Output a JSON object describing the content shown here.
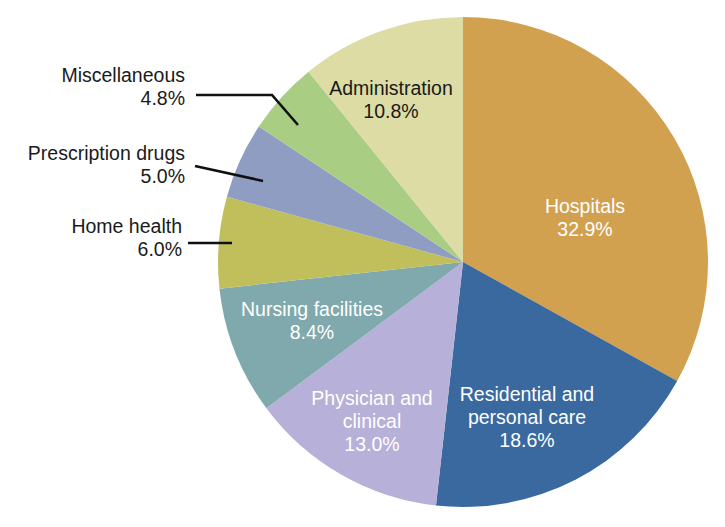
{
  "chart_data": {
    "type": "pie",
    "title": "",
    "subtitle": "",
    "xlabel": "",
    "ylabel": "",
    "legend_position": "none",
    "grid": false,
    "units": "percent",
    "start_angle_deg": 0,
    "direction": "clockwise",
    "center": {
      "x": 463,
      "y": 262
    },
    "radius": 245,
    "categories": [
      "Hospitals",
      "Residential and personal care",
      "Physician and clinical",
      "Nursing facilities",
      "Home health",
      "Prescription drugs",
      "Miscellaneous",
      "Administration"
    ],
    "values": [
      32.9,
      18.6,
      13.0,
      8.4,
      6.0,
      5.0,
      4.8,
      10.8
    ],
    "colors": [
      "#d2a14f",
      "#39699f",
      "#b7b0d8",
      "#7fa9ac",
      "#c0bf5c",
      "#8f9dc2",
      "#aacd84",
      "#dcdca4"
    ],
    "slices": [
      {
        "name": "Hospitals",
        "value": 32.9,
        "value_label": "32.9%",
        "color": "#d2a14f",
        "label_lines": [
          "Hospitals",
          "32.9%"
        ],
        "label_placement": "inside",
        "label_color": "#ffffff",
        "label_x": 585,
        "label_y": 208
      },
      {
        "name": "Residential and personal care",
        "value": 18.6,
        "value_label": "18.6%",
        "color": "#39699f",
        "label_lines": [
          "Residential and",
          "personal care",
          "18.6%"
        ],
        "label_placement": "inside",
        "label_color": "#ffffff",
        "label_x": 527,
        "label_y": 396
      },
      {
        "name": "Physician and clinical",
        "value": 13.0,
        "value_label": "13.0%",
        "color": "#b7b0d8",
        "label_lines": [
          "Physician and",
          "clinical",
          "13.0%"
        ],
        "label_placement": "inside",
        "label_color": "#ffffff",
        "label_x": 372,
        "label_y": 400
      },
      {
        "name": "Nursing facilities",
        "value": 8.4,
        "value_label": "8.4%",
        "color": "#7fa9ac",
        "label_lines": [
          "Nursing facilities",
          "8.4%"
        ],
        "label_placement": "inside",
        "label_color": "#ffffff",
        "label_x": 312,
        "label_y": 311
      },
      {
        "name": "Home health",
        "value": 6.0,
        "value_label": "6.0%",
        "color": "#c0bf5c",
        "label_lines": [
          "Home health",
          "6.0%"
        ],
        "label_placement": "callout-left",
        "label_color": "#1a1a1a",
        "label_x": 182,
        "label_y": 228,
        "leader_points": "188,243 232,243"
      },
      {
        "name": "Prescription drugs",
        "value": 5.0,
        "value_label": "5.0%",
        "color": "#8f9dc2",
        "label_lines": [
          "Prescription drugs",
          "5.0%"
        ],
        "label_placement": "callout-left",
        "label_color": "#1a1a1a",
        "label_x": 185,
        "label_y": 155,
        "leader_points": "195,166 263,181"
      },
      {
        "name": "Miscellaneous",
        "value": 4.8,
        "value_label": "4.8%",
        "color": "#aacd84",
        "label_lines": [
          "Miscellaneous",
          "4.8%"
        ],
        "label_placement": "callout-left",
        "label_color": "#1a1a1a",
        "label_x": 185,
        "label_y": 77,
        "leader_points": "196,95 272,95 298,125"
      },
      {
        "name": "Administration",
        "value": 10.8,
        "value_label": "10.8%",
        "color": "#dcdca4",
        "label_lines": [
          "Administration",
          "10.8%"
        ],
        "label_placement": "inside",
        "label_color": "#1a1a1a",
        "label_x": 391,
        "label_y": 90
      }
    ]
  }
}
